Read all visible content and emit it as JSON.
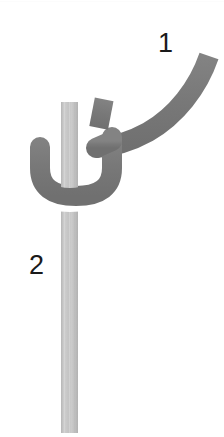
{
  "figure": {
    "kind": "knot-tying-diagram",
    "width": 224,
    "height": 437,
    "background_color": "#ffffff"
  },
  "labels": {
    "working_end": "1",
    "standing_part": "2"
  },
  "colors": {
    "working_rope": "#7c7c7c",
    "working_rope_shade": "#6e6e6e",
    "standing_rope": "#c2c2c2",
    "standing_rope_shade": "#b4b4b4",
    "standing_rope_highlight": "#d2d2d2",
    "label_text": "#1a1a1a",
    "background": "#ffffff"
  },
  "geometry": {
    "standing_rope": {
      "x_left": 61,
      "x_right": 78,
      "y_top": 102,
      "y_bottom": 433,
      "width": 17
    },
    "working_rope": {
      "stroke_width": 20,
      "tip_x": 211,
      "tip_y": 53,
      "loop_left_x": 39,
      "loop_bottom_y": 196,
      "loop_right_x": 113
    },
    "stub_segment": {
      "x": 92,
      "y": 99,
      "width": 18,
      "height": 29,
      "rotation_deg": 12
    }
  },
  "crossings": {
    "upper": "standing-rope-over-working-rope",
    "lower": "working-rope-over-standing-rope"
  }
}
